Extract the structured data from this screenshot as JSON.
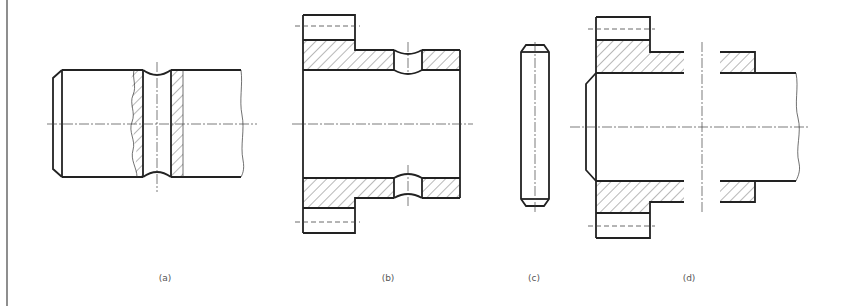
{
  "figure": {
    "type": "engineering-drawing",
    "views": [
      {
        "id": "a",
        "label": "(a)",
        "description": "Shaft with chamfered end, annular groove, broken-out hatched section"
      },
      {
        "id": "b",
        "label": "(b)",
        "description": "Flanged bushing in full section with radial holes and hidden-line bolt holes"
      },
      {
        "id": "c",
        "label": "(c)",
        "description": "Cylindrical pin with chamfered ends"
      },
      {
        "id": "d",
        "label": "(d)",
        "description": "Assembly of flanged bushing on shaft, broken view"
      }
    ]
  },
  "colors": {
    "line": "#222222",
    "background": "#ffffff",
    "label": "#555555"
  }
}
